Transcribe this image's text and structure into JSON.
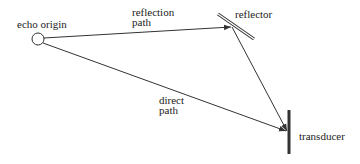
{
  "diagram": {
    "nodes": {
      "echo_origin": {
        "label": "echo origin"
      },
      "reflector": {
        "label": "reflector"
      },
      "transducer": {
        "label": "transducer"
      }
    },
    "edges": [
      {
        "from": "echo_origin",
        "to": "reflector",
        "label_line1": "reflection",
        "label_line2": "path"
      },
      {
        "from": "reflector",
        "to": "transducer",
        "label_line1": "",
        "label_line2": ""
      },
      {
        "from": "echo_origin",
        "to": "transducer",
        "label_line1": "direct",
        "label_line2": "path"
      }
    ],
    "colors": {
      "stroke": "#333333",
      "background": "#ffffff"
    }
  }
}
